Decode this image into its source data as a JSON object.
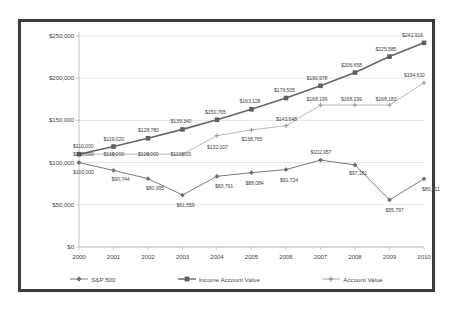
{
  "chart_data": {
    "type": "line",
    "title": "",
    "xlabel": "",
    "ylabel": "",
    "categories": [
      "2000",
      "2001",
      "2002",
      "2003",
      "2004",
      "2005",
      "2006",
      "2007",
      "2008",
      "2009",
      "2010"
    ],
    "ylim": [
      0,
      250000
    ],
    "yticks": [
      "$0",
      "$50,000",
      "$100,000",
      "$150,000",
      "$200,000",
      "$250,000"
    ],
    "ytick_values": [
      0,
      50000,
      100000,
      150000,
      200000,
      250000
    ],
    "grid": true,
    "legend_position": "bottom",
    "series": [
      {
        "name": "S&P 500",
        "color": "#7a7a7a",
        "marker": "diamond",
        "values": [
          100000,
          90744,
          80995,
          61559,
          83791,
          88084,
          91724,
          102957,
          97181,
          55797,
          80811
        ],
        "labels": [
          "$100,000",
          "$90,744",
          "$80,995",
          "$61,559",
          "$83,791",
          "$88,084",
          "$91,724",
          "$102,957",
          "$97,181",
          "$55,797",
          "$80,811"
        ]
      },
      {
        "name": "Income Account Value",
        "color": "#666666",
        "marker": "square",
        "values": [
          110000,
          119020,
          128780,
          139340,
          150765,
          163128,
          176505,
          190978,
          206658,
          225585,
          241916
        ],
        "labels": [
          "$110,000",
          "$119,020",
          "$128,780",
          "$139,340",
          "$150,765",
          "$163,128",
          "$176,505",
          "$190,978",
          "$206,658",
          "$225,585",
          "$241,916"
        ]
      },
      {
        "name": "Account Value",
        "color": "#b0b0b0",
        "marker": "cross",
        "values": [
          110000,
          110000,
          110000,
          110000,
          132007,
          138765,
          143648,
          168199,
          168199,
          168183,
          194632
        ],
        "labels": [
          "$110,000",
          "$110,000",
          "$110,000",
          "$110,000",
          "$132,007",
          "$138,765",
          "$143,648",
          "$168,199",
          "$168,199",
          "$168,183",
          "$194,632"
        ]
      }
    ]
  },
  "legend": {
    "items": [
      {
        "label": "S&P 500",
        "marker": "line-diamond-marker"
      },
      {
        "label": "Income Account Value",
        "marker": "line-square-marker"
      },
      {
        "label": "Account Value",
        "marker": "line-cross-marker"
      }
    ]
  },
  "colors": {
    "frame": "#3c3c3c",
    "grid": "#d9d9d9",
    "text": "#4a4a4a",
    "sp500": "#7a7a7a",
    "income": "#666666",
    "account": "#b0b0b0"
  }
}
